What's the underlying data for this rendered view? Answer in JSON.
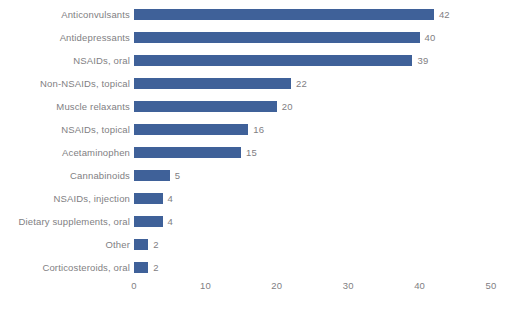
{
  "chart_data": {
    "type": "bar",
    "orientation": "horizontal",
    "title": "",
    "subtitle": "",
    "xlabel": "",
    "ylabel": "",
    "xlim": [
      0,
      50
    ],
    "xticks": [
      "0",
      "10",
      "20",
      "30",
      "40",
      "50"
    ],
    "xtick_values": [
      0,
      10,
      20,
      30,
      40,
      50
    ],
    "grid": false,
    "legend": false,
    "show_value_labels": true,
    "categories": [
      "Anticonvulsants",
      "Antidepressants",
      "NSAIDs, oral",
      "Non-NSAIDs, topical",
      "Muscle relaxants",
      "NSAIDs, topical",
      "Acetaminophen",
      "Cannabinoids",
      "NSAIDs, injection",
      "Dietary supplements, oral",
      "Other",
      "Corticosteroids, oral"
    ],
    "values": [
      42,
      40,
      39,
      22,
      20,
      16,
      15,
      5,
      4,
      4,
      2,
      2
    ],
    "value_labels": [
      "42",
      "40",
      "39",
      "22",
      "20",
      "16",
      "15",
      "5",
      "4",
      "4",
      "2",
      "2"
    ],
    "colors": {
      "bar": "#3f6199",
      "label_text": "#7f8083",
      "value_text": "#7f8083",
      "background": "#ffffff"
    }
  }
}
